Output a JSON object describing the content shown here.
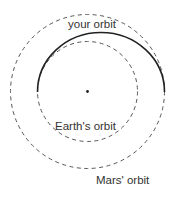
{
  "diagram": {
    "labels": {
      "your_orbit": "your orbit",
      "earth_orbit": "Earth's orbit",
      "mars_orbit": "Mars' orbit"
    },
    "elements": {
      "sun": {
        "cx": 87.5,
        "cy": 91.5,
        "r": 1.4,
        "color": "#222222"
      },
      "earth_orbit": {
        "cx": 87.5,
        "cy": 91.5,
        "r": 50,
        "style": "dashed",
        "color": "#555555"
      },
      "mars_orbit": {
        "cx": 87.5,
        "cy": 91.5,
        "r": 77,
        "style": "dashed",
        "color": "#555555"
      },
      "transfer_orbit": {
        "from": "Earth's orbit (left)",
        "to": "Mars' orbit (right)",
        "style": "solid",
        "color": "#222222"
      }
    }
  }
}
